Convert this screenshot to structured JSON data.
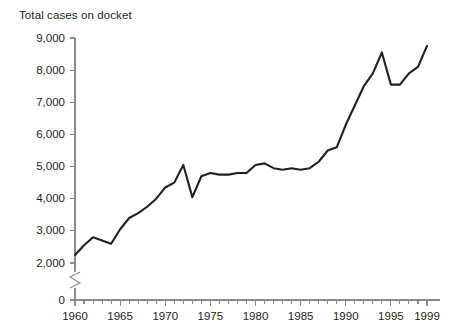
{
  "chart_data": {
    "type": "line",
    "title": "Total cases on docket",
    "xlabel": "",
    "ylabel": "",
    "grid": false,
    "legend": false,
    "axis_break": {
      "present": true,
      "between": [
        0,
        2000
      ],
      "symbol": "zigzag"
    },
    "xlim": [
      1960,
      1999
    ],
    "ylim": [
      0,
      9000
    ],
    "y_ticks": [
      0,
      2000,
      3000,
      4000,
      5000,
      6000,
      7000,
      8000,
      9000
    ],
    "y_tick_labels": [
      "0",
      "2,000",
      "3,000",
      "4,000",
      "5,000",
      "6,000",
      "7,000",
      "8,000",
      "9,000"
    ],
    "x_ticks_all": [
      1960,
      1961,
      1962,
      1963,
      1964,
      1965,
      1966,
      1967,
      1968,
      1969,
      1970,
      1971,
      1972,
      1973,
      1974,
      1975,
      1976,
      1977,
      1978,
      1979,
      1980,
      1981,
      1982,
      1983,
      1984,
      1985,
      1986,
      1987,
      1988,
      1989,
      1990,
      1991,
      1992,
      1993,
      1994,
      1995,
      1996,
      1997,
      1998,
      1999
    ],
    "x_tick_labels": [
      {
        "value": 1960,
        "label": "1960"
      },
      {
        "value": 1965,
        "label": "1965"
      },
      {
        "value": 1970,
        "label": "1970"
      },
      {
        "value": 1975,
        "label": "1975"
      },
      {
        "value": 1980,
        "label": "1980"
      },
      {
        "value": 1985,
        "label": "1985"
      },
      {
        "value": 1990,
        "label": "1990"
      },
      {
        "value": 1995,
        "label": "1995"
      },
      {
        "value": 1999,
        "label": "1999"
      }
    ],
    "x": [
      1960,
      1961,
      1962,
      1963,
      1964,
      1965,
      1966,
      1967,
      1968,
      1969,
      1970,
      1971,
      1972,
      1973,
      1974,
      1975,
      1976,
      1977,
      1978,
      1979,
      1980,
      1981,
      1982,
      1983,
      1984,
      1985,
      1986,
      1987,
      1988,
      1989,
      1990,
      1991,
      1992,
      1993,
      1994,
      1995,
      1996,
      1997,
      1998,
      1999
    ],
    "values": [
      2250,
      2550,
      2800,
      2700,
      2600,
      3050,
      3400,
      3550,
      3750,
      4000,
      4350,
      4500,
      5050,
      4050,
      4700,
      4800,
      4750,
      4750,
      4800,
      4800,
      5050,
      5100,
      4950,
      4900,
      4950,
      4900,
      4950,
      5150,
      5500,
      5600,
      6300,
      6900,
      7500,
      7900,
      8550,
      7550,
      7550,
      7900,
      8100,
      8750
    ],
    "series_color": "#231f20",
    "axis_color": "#8a8a8a"
  }
}
